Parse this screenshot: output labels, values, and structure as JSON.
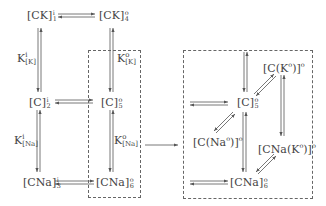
{
  "diagram": {
    "type": "kinetic-state-scheme",
    "left_scheme": {
      "nodes": [
        {
          "id": "CK_i_1",
          "base": "[CK]",
          "sup": "i",
          "sub": "1"
        },
        {
          "id": "CK_o_4",
          "base": "[CK]",
          "sup": "o",
          "sub": "4"
        },
        {
          "id": "C_i_2",
          "base": "[C]",
          "sup": "i",
          "sub": "2"
        },
        {
          "id": "C_o_5",
          "base": "[C]",
          "sup": "o",
          "sub": "5"
        },
        {
          "id": "CNa_i_3",
          "base": "[CNa]",
          "sup": "i",
          "sub": "3"
        },
        {
          "id": "CNa_o_6",
          "base": "[CNa]",
          "sup": "o",
          "sub": "6"
        }
      ],
      "equilibrium_labels": [
        {
          "id": "K_i_K",
          "base": "K",
          "sup": "i",
          "sub": "[K]"
        },
        {
          "id": "K_o_K",
          "base": "K",
          "sup": "o",
          "sub": "[K]"
        },
        {
          "id": "K_i_Na",
          "base": "K",
          "sup": "i",
          "sub": "[Na]"
        },
        {
          "id": "K_o_Na",
          "base": "K",
          "sup": "o",
          "sub": "[Na]"
        }
      ],
      "edges": [
        {
          "from": "CK_i_1",
          "to": "CK_o_4",
          "type": "reversible"
        },
        {
          "from": "CK_i_1",
          "to": "C_i_2",
          "type": "reversible",
          "label": "K_i_K"
        },
        {
          "from": "CK_o_4",
          "to": "C_o_5",
          "type": "reversible",
          "label": "K_o_K"
        },
        {
          "from": "C_i_2",
          "to": "C_o_5",
          "type": "reversible"
        },
        {
          "from": "C_i_2",
          "to": "CNa_i_3",
          "type": "reversible",
          "label": "K_i_Na"
        },
        {
          "from": "C_o_5",
          "to": "CNa_o_6",
          "type": "reversible",
          "label": "K_o_Na"
        },
        {
          "from": "CNa_i_3",
          "to": "CNa_o_6",
          "type": "reversible"
        }
      ],
      "highlight_box": "dashed box around C_o_5 and CNa_o_6"
    },
    "expansion_arrow": "left dashed box expands into right dashed box",
    "right_scheme": {
      "nodes": [
        {
          "id": "C_o_5",
          "base": "[C]",
          "sup": "o",
          "sub": "5"
        },
        {
          "id": "C_Ko",
          "text": "[C(K",
          "inner_sup": "o",
          "close": ")]",
          "sup": "o"
        },
        {
          "id": "C_Nao",
          "text": "[C(Na",
          "inner_sup": "o",
          "close": ")]",
          "sup": "o"
        },
        {
          "id": "CNa_Ko",
          "text": "[CNa(K",
          "inner_sup": "o",
          "close": ")]",
          "sup": "o"
        },
        {
          "id": "CNa_o_6",
          "base": "[CNa]",
          "sup": "o",
          "sub": "6"
        }
      ],
      "edges": [
        {
          "from": "C_o_5",
          "to": "C_Ko",
          "type": "reversible"
        },
        {
          "from": "C_o_5",
          "to": "C_Nao",
          "type": "reversible"
        },
        {
          "from": "C_o_5",
          "to": "CNa_o_6",
          "type": "reversible"
        },
        {
          "from": "C_Ko",
          "to": "CNa_Ko",
          "type": "reversible"
        },
        {
          "from": "CNa_Ko",
          "to": "CNa_o_6",
          "type": "reversible"
        }
      ]
    }
  }
}
